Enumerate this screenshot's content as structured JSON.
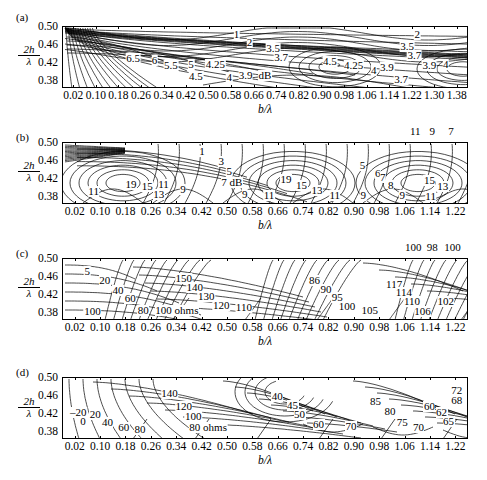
{
  "figure": {
    "axis_y_label_num": "2h",
    "axis_y_label_den": "λ",
    "axis_x_label": "b/λ",
    "y_ticks": [
      "0.50",
      "0.46",
      "0.42",
      "0.38"
    ],
    "x_ticks_long": [
      "0.02",
      "0.10",
      "0.18",
      "0.26",
      "0.34",
      "0.42",
      "0.50",
      "0.58",
      "0.66",
      "0.74",
      "0.82",
      "0.90",
      "0.98",
      "1.06",
      "1.14",
      "1.22",
      "1.30",
      "1.38"
    ],
    "x_ticks_short": [
      "0.02",
      "0.10",
      "0.18",
      "0.26",
      "0.34",
      "0.42",
      "0.50",
      "0.58",
      "0.66",
      "0.74",
      "0.82",
      "0.90",
      "0.98",
      "1.06",
      "1.14",
      "1.22"
    ]
  },
  "panels": [
    {
      "tag": "(a)",
      "quantity": "dB",
      "xmax": "1.38",
      "labels": [
        {
          "t": "1",
          "x": 0.43,
          "y": 0.13
        },
        {
          "t": "2",
          "x": 0.462,
          "y": 0.27
        },
        {
          "t": "2",
          "x": 0.875,
          "y": 0.13
        },
        {
          "t": "3.5",
          "x": 0.52,
          "y": 0.36
        },
        {
          "t": "3.7",
          "x": 0.54,
          "y": 0.5
        },
        {
          "t": "3.5",
          "x": 0.85,
          "y": 0.33
        },
        {
          "t": "3.7",
          "x": 0.868,
          "y": 0.47
        },
        {
          "t": "6.5",
          "x": 0.175,
          "y": 0.52
        },
        {
          "t": "6",
          "x": 0.228,
          "y": 0.56
        },
        {
          "t": "5.5",
          "x": 0.268,
          "y": 0.64
        },
        {
          "t": "5",
          "x": 0.318,
          "y": 0.62
        },
        {
          "t": "4.25",
          "x": 0.378,
          "y": 0.62
        },
        {
          "t": "4.5",
          "x": 0.33,
          "y": 0.82
        },
        {
          "t": "4",
          "x": 0.412,
          "y": 0.83
        },
        {
          "t": "3.9",
          "x": 0.452,
          "y": 0.8
        },
        {
          "t": "dB",
          "x": 0.5,
          "y": 0.8
        },
        {
          "t": "4.5",
          "x": 0.66,
          "y": 0.58
        },
        {
          "t": "4.25",
          "x": 0.718,
          "y": 0.64
        },
        {
          "t": "4",
          "x": 0.768,
          "y": 0.72
        },
        {
          "t": "3.9",
          "x": 0.8,
          "y": 0.67
        },
        {
          "t": "3.9",
          "x": 0.905,
          "y": 0.63
        },
        {
          "t": "4",
          "x": 0.945,
          "y": 0.62
        },
        {
          "t": "3.7",
          "x": 0.835,
          "y": 0.86
        }
      ]
    },
    {
      "tag": "(b)",
      "quantity": "dB",
      "xmax": "1.22",
      "labels": [
        {
          "t": "1",
          "x": 0.345,
          "y": 0.16
        },
        {
          "t": "3",
          "x": 0.392,
          "y": 0.32
        },
        {
          "t": "5",
          "x": 0.412,
          "y": 0.48
        },
        {
          "t": "7 dB",
          "x": 0.418,
          "y": 0.66
        },
        {
          "t": "5",
          "x": 0.74,
          "y": 0.38
        },
        {
          "t": "6",
          "x": 0.778,
          "y": 0.5
        },
        {
          "t": "7",
          "x": 0.79,
          "y": 0.58
        },
        {
          "t": "8",
          "x": 0.81,
          "y": 0.7
        },
        {
          "t": "11",
          "x": 0.078,
          "y": 0.8
        },
        {
          "t": "19",
          "x": 0.17,
          "y": 0.68
        },
        {
          "t": "15",
          "x": 0.21,
          "y": 0.72
        },
        {
          "t": "13",
          "x": 0.238,
          "y": 0.84
        },
        {
          "t": "11",
          "x": 0.25,
          "y": 0.68
        },
        {
          "t": "9",
          "x": 0.298,
          "y": 0.76
        },
        {
          "t": "9",
          "x": 0.45,
          "y": 0.84
        },
        {
          "t": "19",
          "x": 0.552,
          "y": 0.6
        },
        {
          "t": "15",
          "x": 0.59,
          "y": 0.7
        },
        {
          "t": "13",
          "x": 0.628,
          "y": 0.78
        },
        {
          "t": "11",
          "x": 0.51,
          "y": 0.86
        },
        {
          "t": "11",
          "x": 0.672,
          "y": 0.86
        },
        {
          "t": "9",
          "x": 0.742,
          "y": 0.86
        },
        {
          "t": "9",
          "x": 0.838,
          "y": 0.86
        },
        {
          "t": "15",
          "x": 0.905,
          "y": 0.62
        },
        {
          "t": "13",
          "x": 0.938,
          "y": 0.72
        },
        {
          "t": "11",
          "x": 0.908,
          "y": 0.88
        }
      ],
      "outside_labels": [
        {
          "t": "11",
          "x": 0.87,
          "y": -0.17
        },
        {
          "t": "9",
          "x": 0.912,
          "y": -0.17
        },
        {
          "t": "7",
          "x": 0.958,
          "y": -0.17
        }
      ]
    },
    {
      "tag": "(c)",
      "quantity": "ohms",
      "xmax": "1.22",
      "labels": [
        {
          "t": "5",
          "x": 0.062,
          "y": 0.22
        },
        {
          "t": "20",
          "x": 0.105,
          "y": 0.36
        },
        {
          "t": "40",
          "x": 0.138,
          "y": 0.52
        },
        {
          "t": "60",
          "x": 0.168,
          "y": 0.66
        },
        {
          "t": "80",
          "x": 0.2,
          "y": 0.84
        },
        {
          "t": "100",
          "x": 0.075,
          "y": 0.86
        },
        {
          "t": "100 ohms",
          "x": 0.283,
          "y": 0.85
        },
        {
          "t": "150",
          "x": 0.3,
          "y": 0.33
        },
        {
          "t": "140",
          "x": 0.327,
          "y": 0.47
        },
        {
          "t": "130",
          "x": 0.355,
          "y": 0.62
        },
        {
          "t": "120",
          "x": 0.392,
          "y": 0.76
        },
        {
          "t": "110",
          "x": 0.448,
          "y": 0.8
        },
        {
          "t": "86",
          "x": 0.622,
          "y": 0.36
        },
        {
          "t": "90",
          "x": 0.65,
          "y": 0.5
        },
        {
          "t": "95",
          "x": 0.678,
          "y": 0.63
        },
        {
          "t": "100",
          "x": 0.702,
          "y": 0.79
        },
        {
          "t": "105",
          "x": 0.758,
          "y": 0.84
        },
        {
          "t": "117",
          "x": 0.818,
          "y": 0.42
        },
        {
          "t": "114",
          "x": 0.842,
          "y": 0.55
        },
        {
          "t": "110",
          "x": 0.862,
          "y": 0.7
        },
        {
          "t": "106",
          "x": 0.888,
          "y": 0.86
        },
        {
          "t": "102",
          "x": 0.945,
          "y": 0.7
        }
      ],
      "outside_labels": [
        {
          "t": "100",
          "x": 0.865,
          "y": -0.17
        },
        {
          "t": "98",
          "x": 0.912,
          "y": -0.17
        },
        {
          "t": "100",
          "x": 0.962,
          "y": -0.17
        }
      ]
    },
    {
      "tag": "(d)",
      "quantity": "ohms",
      "xmax": "1.22",
      "labels": [
        {
          "t": "–20",
          "x": 0.04,
          "y": 0.58
        },
        {
          "t": "0",
          "x": 0.052,
          "y": 0.72
        },
        {
          "t": "20",
          "x": 0.082,
          "y": 0.6
        },
        {
          "t": "40",
          "x": 0.112,
          "y": 0.74
        },
        {
          "t": "60",
          "x": 0.152,
          "y": 0.82
        },
        {
          "t": "80",
          "x": 0.192,
          "y": 0.84
        },
        {
          "t": "140",
          "x": 0.265,
          "y": 0.27
        },
        {
          "t": "120",
          "x": 0.3,
          "y": 0.48
        },
        {
          "t": "100",
          "x": 0.323,
          "y": 0.64
        },
        {
          "t": "80 ohms",
          "x": 0.36,
          "y": 0.82
        },
        {
          "t": "40",
          "x": 0.53,
          "y": 0.32
        },
        {
          "t": "45",
          "x": 0.568,
          "y": 0.46
        },
        {
          "t": "50",
          "x": 0.585,
          "y": 0.6
        },
        {
          "t": "60",
          "x": 0.632,
          "y": 0.76
        },
        {
          "t": "70",
          "x": 0.712,
          "y": 0.8
        },
        {
          "t": "85",
          "x": 0.772,
          "y": 0.4
        },
        {
          "t": "80",
          "x": 0.808,
          "y": 0.56
        },
        {
          "t": "75",
          "x": 0.838,
          "y": 0.74
        },
        {
          "t": "70",
          "x": 0.878,
          "y": 0.82
        },
        {
          "t": "60",
          "x": 0.905,
          "y": 0.48
        },
        {
          "t": "62",
          "x": 0.935,
          "y": 0.58
        },
        {
          "t": "65",
          "x": 0.952,
          "y": 0.72
        },
        {
          "t": "72",
          "x": 0.972,
          "y": 0.22
        },
        {
          "t": "68",
          "x": 0.972,
          "y": 0.38
        }
      ]
    }
  ]
}
